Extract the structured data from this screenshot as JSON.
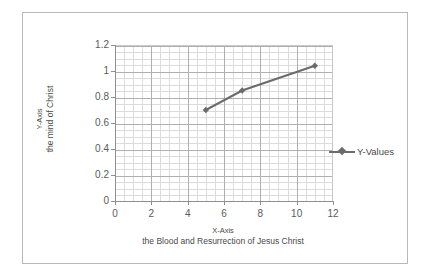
{
  "chart_data": {
    "type": "line",
    "title": "",
    "xlabel": "X-Axis",
    "xlabel_sub": "the Blood and Resurrection of Jesus Christ",
    "ylabel": "Y-Axis",
    "ylabel_sub": "the mind of Christ",
    "x": [
      5,
      7,
      11
    ],
    "values": [
      0.7,
      0.85,
      1.04
    ],
    "series": [
      {
        "name": "Y-Values",
        "x": [
          5,
          7,
          11
        ],
        "values": [
          0.7,
          0.85,
          1.04
        ]
      }
    ],
    "xlim": [
      0,
      12
    ],
    "ylim": [
      0,
      1.2
    ],
    "x_ticks": [
      "0",
      "2",
      "4",
      "6",
      "8",
      "10",
      "12"
    ],
    "y_ticks": [
      "1.2",
      "1",
      "0.8",
      "0.6",
      "0.4",
      "0.2",
      "0"
    ],
    "x_tick_values": [
      0,
      2,
      4,
      6,
      8,
      10,
      12
    ],
    "y_tick_values": [
      1.2,
      1.0,
      0.8,
      0.6,
      0.4,
      0.2,
      0
    ],
    "grid": true,
    "minor_grid": true,
    "legend": [
      "Y-Values"
    ],
    "legend_position": "right",
    "marker": "diamond",
    "series_color": "#6b6b6b",
    "grid_color": "#b0b0b0",
    "minor_grid_color": "#dcdcdc",
    "axis_color": "#8f8f8f",
    "border_color": "#b9b9b9",
    "background": "#ffffff"
  },
  "legend": {
    "entry_label": "Y-Values"
  },
  "axes": {
    "y_title_line1": "Y-Axis",
    "y_title_line2": "the mind of Christ",
    "x_title_line1": "X-Axis",
    "x_title_line2": "the Blood and Resurrection of Jesus Christ"
  }
}
